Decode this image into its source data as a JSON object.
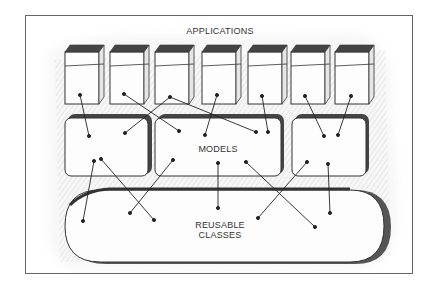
{
  "title": "APPLICATIONS",
  "layers": {
    "applications": {
      "label": "APPLICATIONS",
      "count": 7
    },
    "models": {
      "label": "MODELS",
      "count": 3
    },
    "reusable_classes": {
      "label_line1": "REUSABLE",
      "label_line2": "CLASSES"
    }
  },
  "colors": {
    "background": "#ffffff",
    "frame": "#555555",
    "box_fill": "#fbfbfb",
    "box_top": "#444444",
    "shadow": "#777777",
    "connector": "#222222",
    "hatch": "#bdbdbd"
  }
}
